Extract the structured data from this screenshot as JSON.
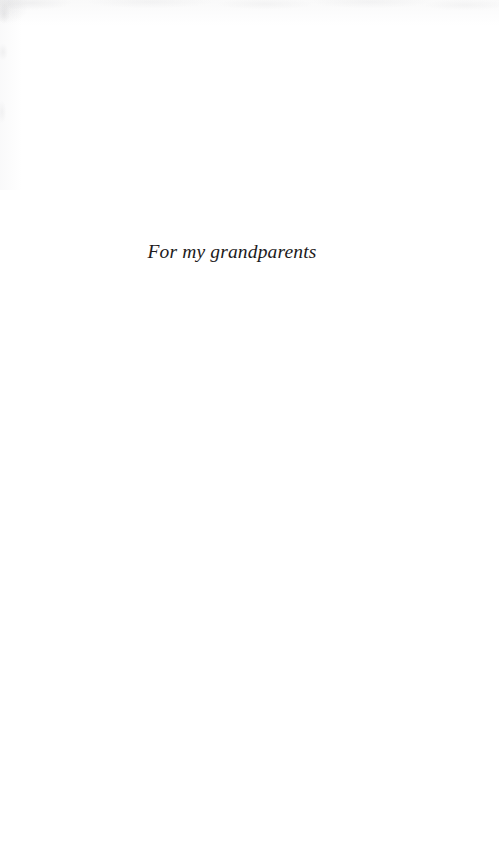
{
  "page": {
    "type": "book-dedication-page",
    "background_color": "#ffffff",
    "text_color": "#1d1b1c",
    "width": 499,
    "height": 858
  },
  "dedication": {
    "text": "For my grandparents"
  }
}
